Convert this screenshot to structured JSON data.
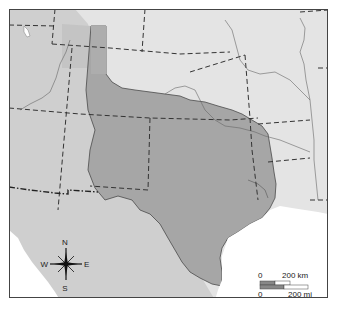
{
  "map": {
    "colors": {
      "background_land": "#e4e4e4",
      "western_land": "#cfcfcf",
      "texas_fill": "#a6a6a6",
      "panhandle_light": "#bdbdbd",
      "panhandle_strip": "#adadad",
      "water": "#ffffff",
      "border": "#555555",
      "frame": "#444444"
    },
    "compass": {
      "north": "N",
      "south": "S",
      "east": "E",
      "west": "W"
    },
    "scale_bar": {
      "km_zero": "0",
      "km_label": "200 km",
      "mi_zero": "0",
      "mi_label": "200 mi"
    }
  }
}
